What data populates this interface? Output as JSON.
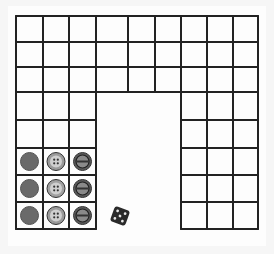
{
  "scene": {
    "description": "Hand-drawn U-shaped grid on paper with nine buttons and a die",
    "paper_color": "#fdfdfd",
    "line_color": "#222222"
  },
  "grid": {
    "cols": [
      16,
      43,
      69,
      96,
      128,
      155,
      181,
      207,
      233,
      258
    ],
    "rows": [
      16,
      42,
      67,
      92,
      120,
      148,
      175,
      202,
      229
    ],
    "top_band_rows": 3,
    "left_arm_cols": 3,
    "right_arm_cols": 3
  },
  "buttons": [
    {
      "row": 0,
      "col": 0,
      "type": "plain",
      "color": "#6a6a6a"
    },
    {
      "row": 0,
      "col": 1,
      "type": "four-hole",
      "color": "#9a9a9a"
    },
    {
      "row": 0,
      "col": 2,
      "type": "ring",
      "color": "#5a5a5a"
    },
    {
      "row": 1,
      "col": 0,
      "type": "plain",
      "color": "#6a6a6a"
    },
    {
      "row": 1,
      "col": 1,
      "type": "four-hole",
      "color": "#a0a0a0"
    },
    {
      "row": 1,
      "col": 2,
      "type": "ring",
      "color": "#5a5a5a"
    },
    {
      "row": 2,
      "col": 0,
      "type": "plain",
      "color": "#6a6a6a"
    },
    {
      "row": 2,
      "col": 1,
      "type": "four-hole",
      "color": "#9a9a9a"
    },
    {
      "row": 2,
      "col": 2,
      "type": "ring",
      "color": "#5a5a5a"
    }
  ],
  "die": {
    "face": 5,
    "color": "#2a2a2a",
    "pip_color": "#e8e8e8"
  }
}
